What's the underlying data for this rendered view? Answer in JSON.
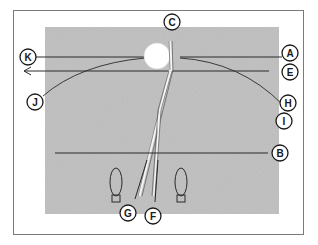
{
  "diagram": {
    "colors": {
      "background": "#ffffff",
      "frame": "#7a7a7a",
      "turf": "#b4b4b4",
      "line": "#2a2a2a",
      "ball": "#ffffff"
    },
    "labels": {
      "A": "A",
      "B": "B",
      "C": "C",
      "E": "E",
      "F": "F",
      "G": "G",
      "H": "H",
      "I": "I",
      "J": "J",
      "K": "K"
    },
    "elements": {
      "ball": "golf ball",
      "club": "club shaft",
      "left_foot": "left foot marker",
      "right_foot": "right foot marker",
      "target_line": "target line",
      "foot_line": "foot line"
    }
  }
}
